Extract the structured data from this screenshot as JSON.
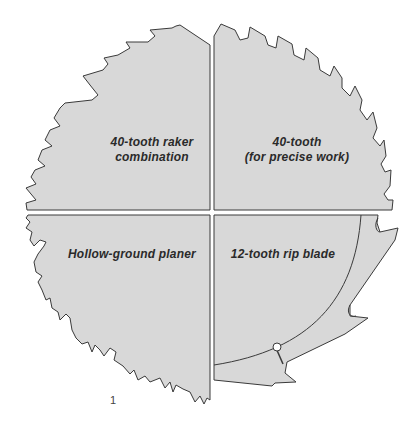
{
  "figure": {
    "number": "1",
    "fill_color": "#d8d8d8",
    "outline_color": "#3a3a3a",
    "quadrants": [
      {
        "position": "top-left",
        "line1": "40-tooth raker",
        "line2": "combination"
      },
      {
        "position": "top-right",
        "line1": "40-tooth",
        "line2": "(for precise work)"
      },
      {
        "position": "bottom-left",
        "line1": "Hollow-ground planer"
      },
      {
        "position": "bottom-right",
        "line1": "12-tooth rip blade"
      }
    ]
  }
}
